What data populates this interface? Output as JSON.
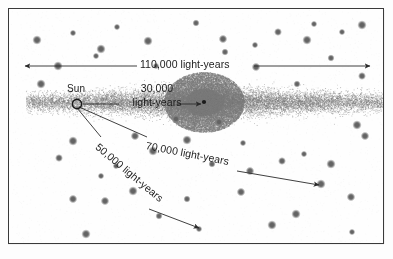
{
  "figure": {
    "background_color": "#fefefe",
    "border_color": "#3a3a3a",
    "ink_color": "#1b1b1b",
    "star_color": "#6f6f6f",
    "disk_color": "#7c7c7c"
  },
  "labels": {
    "sun": "Sun",
    "diameter_line1": "110,000 light-years",
    "sun_to_center_line1": "30,000",
    "sun_to_center_line2": "light-years",
    "to_far_cluster": "70,000 light-years",
    "to_lower_cluster": "50,000 light-years"
  },
  "annotations": [
    {
      "name": "galaxy-diameter",
      "value": "110,000 light-years",
      "kind": "double-arrow",
      "orientation": "horizontal"
    },
    {
      "name": "sun-to-galactic-center",
      "value": "30,000 light-years",
      "kind": "single-arrow",
      "orientation": "horizontal"
    },
    {
      "name": "sun-to-right-cluster",
      "value": "70,000 light-years",
      "kind": "single-arrow",
      "orientation": "diagonal-down-right"
    },
    {
      "name": "sun-to-lower-cluster",
      "value": "50,000 light-years",
      "kind": "single-arrow",
      "orientation": "steep-down-right"
    }
  ],
  "markers": {
    "sun_symbol": "open-circle",
    "galactic_center_symbol": "filled-dot",
    "globular_cluster_symbol": "filled-dot"
  },
  "chart_data": {
    "type": "scatter",
    "xlabel": "",
    "ylabel": "",
    "sun": {
      "x": 76,
      "y": 103
    },
    "galactic_center": {
      "x": 203,
      "y": 101
    },
    "measurements": [
      {
        "label": "110,000 light-years",
        "quantity": 110000,
        "unit": "light-years",
        "describes": "galaxy disk diameter"
      },
      {
        "label": "30,000 light-years",
        "quantity": 30000,
        "unit": "light-years",
        "describes": "Sun to galactic center"
      },
      {
        "label": "70,000 light-years",
        "quantity": 70000,
        "unit": "light-years",
        "describes": "Sun to distant globular cluster (right)"
      },
      {
        "label": "50,000 light-years",
        "quantity": 50000,
        "unit": "light-years",
        "describes": "Sun to globular cluster (lower)"
      }
    ],
    "globular_clusters": [
      [
        36,
        39
      ],
      [
        72,
        32
      ],
      [
        116,
        26
      ],
      [
        147,
        40
      ],
      [
        195,
        22
      ],
      [
        222,
        38
      ],
      [
        224,
        51
      ],
      [
        254,
        44
      ],
      [
        277,
        31
      ],
      [
        306,
        39
      ],
      [
        313,
        23
      ],
      [
        341,
        31
      ],
      [
        361,
        24
      ],
      [
        330,
        57
      ],
      [
        100,
        48
      ],
      [
        57,
        65
      ],
      [
        155,
        65
      ],
      [
        255,
        66
      ],
      [
        40,
        83
      ],
      [
        296,
        83
      ],
      [
        361,
        75
      ],
      [
        95,
        55
      ],
      [
        72,
        140
      ],
      [
        134,
        135
      ],
      [
        186,
        139
      ],
      [
        152,
        150
      ],
      [
        58,
        157
      ],
      [
        115,
        165
      ],
      [
        211,
        163
      ],
      [
        281,
        160
      ],
      [
        303,
        153
      ],
      [
        249,
        170
      ],
      [
        100,
        175
      ],
      [
        330,
        163
      ],
      [
        198,
        228
      ],
      [
        72,
        198
      ],
      [
        104,
        200
      ],
      [
        186,
        198
      ],
      [
        240,
        191
      ],
      [
        320,
        183
      ],
      [
        350,
        196
      ],
      [
        351,
        231
      ],
      [
        271,
        224
      ],
      [
        132,
        190
      ],
      [
        158,
        215
      ],
      [
        85,
        233
      ],
      [
        295,
        213
      ],
      [
        364,
        135
      ],
      [
        356,
        124
      ],
      [
        242,
        142
      ],
      [
        175,
        118
      ],
      [
        218,
        121
      ]
    ]
  }
}
